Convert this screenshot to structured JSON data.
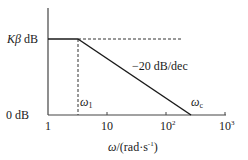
{
  "diagram": {
    "type": "bode-magnitude-asymptote",
    "y_axis": {
      "top_label_symbol": "Kβ",
      "top_label_unit": "dB",
      "bottom_label": "0 dB"
    },
    "x_axis": {
      "ticks": [
        "1",
        "10",
        "10",
        "10"
      ],
      "tick_exponents": [
        "",
        "",
        "2",
        "3"
      ],
      "label_symbol": "ω",
      "label_unit": "/(rad·s",
      "label_unit_exp": "-1",
      "label_close": ")"
    },
    "annotations": {
      "slope": "−20 dB/dec",
      "omega1_symbol": "ω",
      "omega1_sub": "1",
      "omegac_symbol": "ω",
      "omegac_sub": "c"
    },
    "colors": {
      "line": "#1a1a1a",
      "axis": "#333333"
    }
  }
}
